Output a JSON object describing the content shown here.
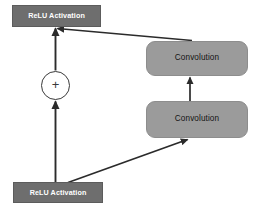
{
  "diagram": {
    "type": "flowchart",
    "canvas": {
      "width": 256,
      "height": 209,
      "background": "#ffffff"
    },
    "colors": {
      "relu_fill": "#6e6e6e",
      "relu_text": "#ffffff",
      "conv_fill": "#9b9b9b",
      "conv_text": "#141414",
      "sum_fill": "#ffffff",
      "sum_stroke": "#3a3a3a",
      "edge_stroke": "#2b2b2b"
    },
    "nodes": [
      {
        "id": "relu_top",
        "label": "ReLU Activation",
        "shape": "rectangle",
        "x": 12,
        "y": 5,
        "width": 89,
        "height": 22
      },
      {
        "id": "sum",
        "label": "+",
        "shape": "circle",
        "x": 41,
        "y": 71,
        "width": 29,
        "height": 29
      },
      {
        "id": "conv_top",
        "label": "Convolution",
        "shape": "rounded-rectangle",
        "x": 146,
        "y": 41,
        "width": 102,
        "height": 35
      },
      {
        "id": "conv_bottom",
        "label": "Convolution",
        "shape": "rounded-rectangle",
        "x": 146,
        "y": 101,
        "width": 102,
        "height": 37
      },
      {
        "id": "relu_bottom",
        "label": "ReLU Activation",
        "shape": "rectangle",
        "x": 13,
        "y": 182,
        "width": 90,
        "height": 21
      }
    ],
    "edges": [
      {
        "id": "e_relu_bottom_to_conv_bottom",
        "from": "relu_bottom",
        "to": "conv_bottom",
        "style": "solid",
        "arrow": "end"
      },
      {
        "id": "e_conv_bottom_to_conv_top",
        "from": "conv_bottom",
        "to": "conv_top",
        "style": "solid",
        "arrow": "end"
      },
      {
        "id": "e_conv_top_to_relu_top",
        "from": "conv_top",
        "to": "relu_top",
        "style": "solid",
        "arrow": "end"
      },
      {
        "id": "e_relu_bottom_to_sum",
        "from": "relu_bottom",
        "to": "sum",
        "style": "solid",
        "arrow": "end"
      },
      {
        "id": "e_sum_to_relu_top",
        "from": "sum",
        "to": "relu_top",
        "style": "solid",
        "arrow": "end"
      }
    ]
  }
}
